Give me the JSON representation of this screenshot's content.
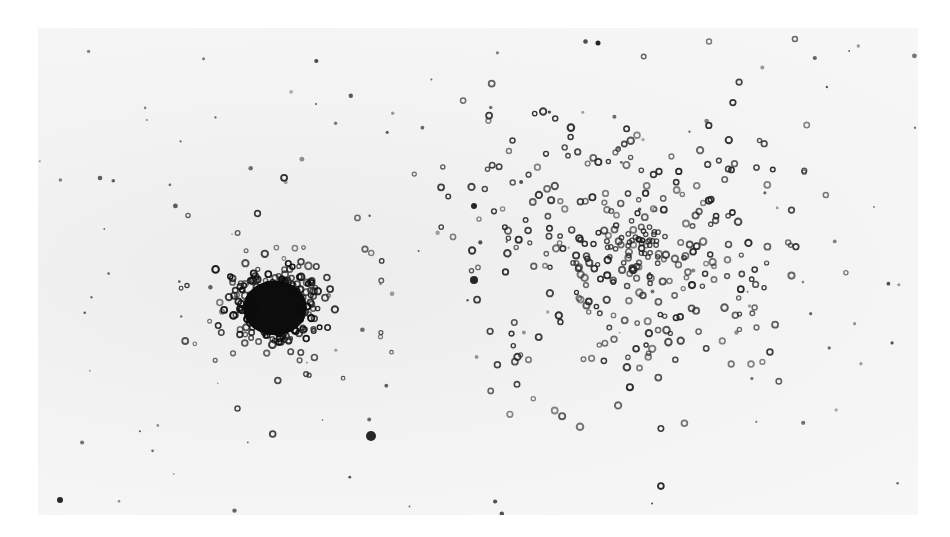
{
  "image": {
    "subject": "photographic negative of two star clusters",
    "background_color": "#f4f4f4",
    "star_color": "#1a1a1a",
    "clusters": [
      {
        "name": "compact-cluster",
        "cx": 237,
        "cy": 280,
        "core_radius": 32,
        "halo_radius": 70,
        "color": "#0d0d0d"
      },
      {
        "name": "open-cluster",
        "cx": 600,
        "cy": 215,
        "spread_x": 160,
        "spread_y": 140,
        "color": "#2a2a2a"
      }
    ],
    "notable_stars": [
      {
        "x": 333,
        "y": 408,
        "r": 5
      },
      {
        "x": 436,
        "y": 252,
        "r": 4
      },
      {
        "x": 436,
        "y": 178,
        "r": 3
      },
      {
        "x": 560,
        "y": 15,
        "r": 2.5
      },
      {
        "x": 22,
        "y": 472,
        "r": 3
      }
    ]
  }
}
